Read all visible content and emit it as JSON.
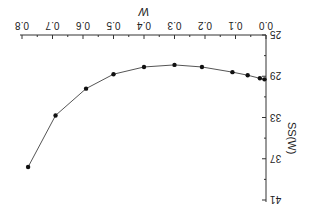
{
  "chart_data": {
    "type": "line",
    "title": "",
    "xlabel": "W",
    "ylabel": "SS(W)",
    "xlim": [
      0.0,
      0.8
    ],
    "ylim": [
      25,
      41
    ],
    "x_ticks": [
      "0.0",
      "0.1",
      "0.2",
      "0.3",
      "0.4",
      "0.5",
      "0.6",
      "0.7",
      "0.8"
    ],
    "y_ticks": [
      "25",
      "29",
      "33",
      "37",
      "41"
    ],
    "grid": false,
    "legend": null,
    "orientation_note": "rendered rotated 180 degrees",
    "series": [
      {
        "name": "SS(W)",
        "x": [
          0.005,
          0.02,
          0.06,
          0.11,
          0.21,
          0.3,
          0.4,
          0.5,
          0.59,
          0.69,
          0.78
        ],
        "y": [
          29.3,
          29.2,
          28.9,
          28.6,
          28.1,
          27.9,
          28.1,
          28.8,
          30.2,
          32.8,
          37.8
        ]
      }
    ],
    "colors": {
      "line": "#555555",
      "marker": "#111111",
      "axis": "#333333"
    }
  }
}
